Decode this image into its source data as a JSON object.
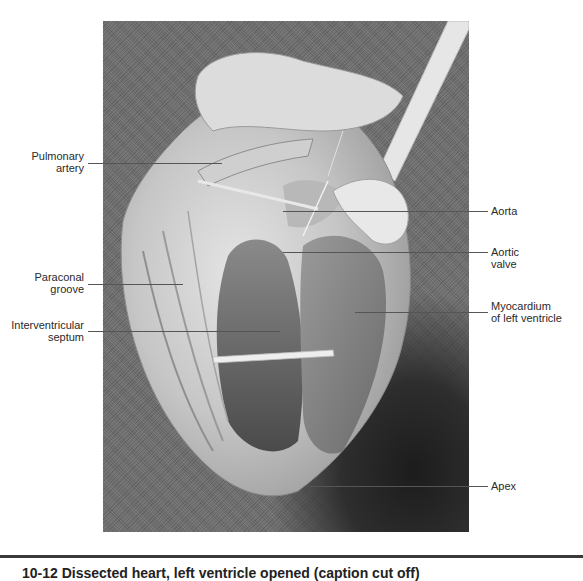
{
  "figure": {
    "subject": "Dissected heart, left ventricle opened",
    "labels": {
      "pulmonary_artery": [
        "Pulmonary",
        "artery"
      ],
      "paraconal_groove": [
        "Paraconal",
        "groove"
      ],
      "interventricular_septum": [
        "Interventricular",
        "septum"
      ],
      "aorta": [
        "Aorta"
      ],
      "aortic_valve": [
        "Aortic",
        "valve"
      ],
      "myocardium": [
        "Myocardium",
        "of left ventricle"
      ],
      "apex": [
        "Apex"
      ]
    },
    "caption_partial": "10-12  Dissected heart, left ventricle opened (caption cut off)"
  },
  "colors": {
    "background_photo": "#6c6c6c",
    "tissue_light": "#d8d8d8",
    "leader_line": "#555555",
    "rule": "#3a3a3a"
  }
}
